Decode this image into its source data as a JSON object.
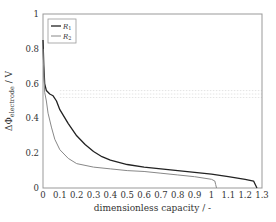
{
  "chart_data": {
    "type": "line",
    "title": "",
    "xlabel": "dimensionless capacity / -",
    "ylabel_main": "ΔΦ",
    "ylabel_sub": "electrode",
    "ylabel_unit": " / V",
    "xlim": [
      0,
      1.3
    ],
    "ylim": [
      0,
      1
    ],
    "xticks": [
      0,
      0.1,
      0.2,
      0.3,
      0.4,
      0.5,
      0.6,
      0.7,
      0.8,
      0.9,
      1,
      1.1,
      1.2,
      1.3
    ],
    "xtick_labels": [
      "0",
      "0.1",
      "0.2",
      "0.3",
      "0.4",
      "0.5",
      "0.6",
      "0.7",
      "0.8",
      "0.9",
      "1",
      "1.1",
      "1.2",
      "1.3"
    ],
    "yticks": [
      0,
      0.2,
      0.4,
      0.6,
      0.8,
      1
    ],
    "ytick_labels": [
      "0",
      "0.2",
      "0.4",
      "0.6",
      "0.8",
      "1"
    ],
    "grid": false,
    "legend_position": "upper left",
    "series": [
      {
        "name": "R1",
        "label_main": "R",
        "label_sub": "1",
        "color": "#222222",
        "width": 1.3,
        "x": [
          0,
          0.005,
          0.01,
          0.02,
          0.04,
          0.06,
          0.08,
          0.1,
          0.15,
          0.2,
          0.25,
          0.3,
          0.35,
          0.4,
          0.5,
          0.6,
          0.7,
          0.8,
          0.9,
          1.0,
          1.1,
          1.2,
          1.25,
          1.26,
          1.27
        ],
        "y": [
          0.85,
          0.7,
          0.6,
          0.56,
          0.54,
          0.53,
          0.5,
          0.45,
          0.37,
          0.3,
          0.25,
          0.21,
          0.18,
          0.16,
          0.135,
          0.12,
          0.11,
          0.1,
          0.09,
          0.08,
          0.065,
          0.05,
          0.04,
          0.02,
          0.0
        ]
      },
      {
        "name": "R2",
        "label_main": "R",
        "label_sub": "2",
        "color": "#888888",
        "width": 1.0,
        "x": [
          0,
          0.005,
          0.01,
          0.02,
          0.03,
          0.05,
          0.07,
          0.1,
          0.15,
          0.2,
          0.3,
          0.4,
          0.5,
          0.6,
          0.7,
          0.8,
          0.9,
          1.0,
          1.02,
          1.025,
          1.03
        ],
        "y": [
          0.8,
          0.65,
          0.55,
          0.5,
          0.43,
          0.35,
          0.28,
          0.22,
          0.17,
          0.14,
          0.12,
          0.11,
          0.1,
          0.095,
          0.085,
          0.075,
          0.065,
          0.05,
          0.04,
          0.02,
          0.0
        ]
      }
    ],
    "reference_bands": {
      "description": "faint dotted horizontal lines",
      "y": [
        0.52,
        0.54,
        0.56
      ],
      "color": "#dddddd"
    }
  },
  "layout": {
    "plot_left": 43,
    "plot_top": 14,
    "plot_right": 262,
    "plot_bottom": 188
  }
}
